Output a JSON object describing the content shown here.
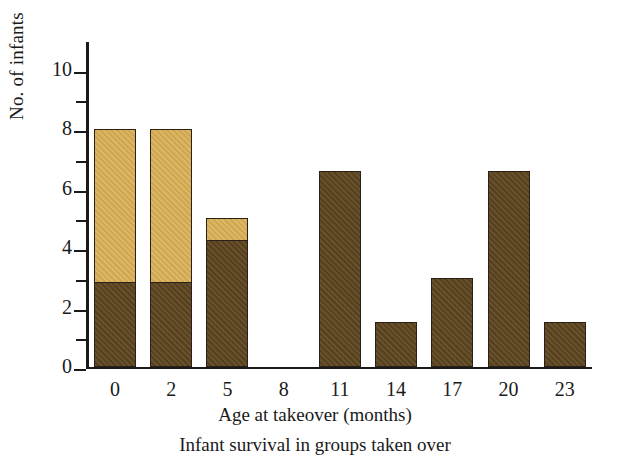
{
  "chart_data": {
    "type": "bar",
    "title": "",
    "caption": "Infant survival in groups taken over",
    "xlabel": "Age at takeover (months)",
    "ylabel": "No. of infants",
    "categories": [
      "0",
      "2",
      "5",
      "8",
      "11",
      "14",
      "17",
      "20",
      "23"
    ],
    "stacked": true,
    "series": [
      {
        "name": "survived",
        "color": "#5e451f",
        "values": [
          2.9,
          2.9,
          4.3,
          0,
          6.6,
          1.5,
          3.0,
          6.6,
          1.5
        ]
      },
      {
        "name": "died",
        "color": "#d7ae53",
        "values": [
          5.1,
          5.1,
          0.7,
          0,
          0,
          0,
          0,
          0,
          0
        ]
      }
    ],
    "totals": [
      8,
      8,
      5,
      0,
      6.6,
      1.5,
      3.0,
      6.6,
      1.5
    ],
    "ylim": [
      0,
      11
    ],
    "ytick_major": [
      "0",
      "2",
      "4",
      "6",
      "8",
      "10"
    ],
    "ytick_major_values": [
      0,
      2,
      4,
      6,
      8,
      10
    ],
    "ytick_minor_values": [
      1,
      3,
      5,
      7,
      9
    ],
    "grid": false,
    "legend": "none"
  },
  "axes": {
    "y_title": "No. of infants",
    "x_title": "Age at takeover (months)"
  },
  "figure_caption": "Infant survival in groups taken over"
}
